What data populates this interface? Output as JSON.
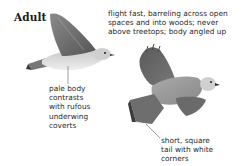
{
  "section": {
    "heading": "Adult"
  },
  "annotations": {
    "flight": {
      "lines": [
        "flight fast, barreling across open",
        "spaces and into woods; never",
        "above treetops; body angled up"
      ]
    },
    "body": {
      "lines": [
        "pale body",
        "contrasts",
        "with rufous",
        "underwing",
        "coverts"
      ]
    },
    "tail": {
      "lines": [
        "short, square",
        "tail with white",
        "corners"
      ]
    }
  },
  "illustrations": [
    {
      "name": "adult-side-view-flight",
      "description": "bird in flight, side view"
    },
    {
      "name": "adult-underside-view-flight",
      "description": "bird in flight, seen from below"
    }
  ],
  "colors": {
    "text": "#2a2a2a",
    "wing_dark": "#6e6e6e",
    "body_pale": "#d8d8d8"
  }
}
